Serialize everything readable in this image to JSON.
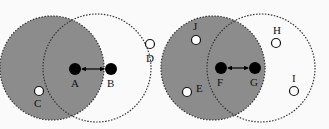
{
  "colors": {
    "background": "#fafafa",
    "shaded_range": "#8c8c8c",
    "boundary": "#333333",
    "node_active": "#000000",
    "node_passive": "#ffffff"
  },
  "diagram": {
    "panels": [
      {
        "id": "left",
        "shaded_circle": {
          "cx": 52,
          "cy": 68,
          "r": 52
        },
        "open_circle": {
          "cx": 97,
          "cy": 68,
          "r": 54
        },
        "active_nodes": [
          {
            "label": "A",
            "x": 75,
            "y": 69,
            "label_x": 71,
            "label_y": 87
          },
          {
            "label": "B",
            "x": 111,
            "y": 69,
            "label_x": 107,
            "label_y": 87
          }
        ],
        "passive_nodes": [
          {
            "label": "C",
            "x": 39,
            "y": 91,
            "label_x": 34,
            "label_y": 107
          },
          {
            "label": "D",
            "x": 150,
            "y": 44,
            "label_x": 146,
            "label_y": 62
          }
        ]
      },
      {
        "id": "right",
        "shaded_circle": {
          "cx": 213,
          "cy": 68,
          "r": 52
        },
        "open_circle": {
          "cx": 261,
          "cy": 68,
          "r": 54
        },
        "active_nodes": [
          {
            "label": "F",
            "x": 221,
            "y": 68,
            "label_x": 217,
            "label_y": 86
          },
          {
            "label": "G",
            "x": 255,
            "y": 68,
            "label_x": 250,
            "label_y": 86
          }
        ],
        "passive_nodes": [
          {
            "label": "J",
            "x": 196,
            "y": 40,
            "label_x": 193,
            "label_y": 30
          },
          {
            "label": "E",
            "x": 187,
            "y": 92,
            "label_x": 196,
            "label_y": 92
          },
          {
            "label": "H",
            "x": 276,
            "y": 43,
            "label_x": 273,
            "label_y": 34
          },
          {
            "label": "I",
            "x": 294,
            "y": 91,
            "label_x": 292,
            "label_y": 82
          }
        ]
      }
    ]
  }
}
